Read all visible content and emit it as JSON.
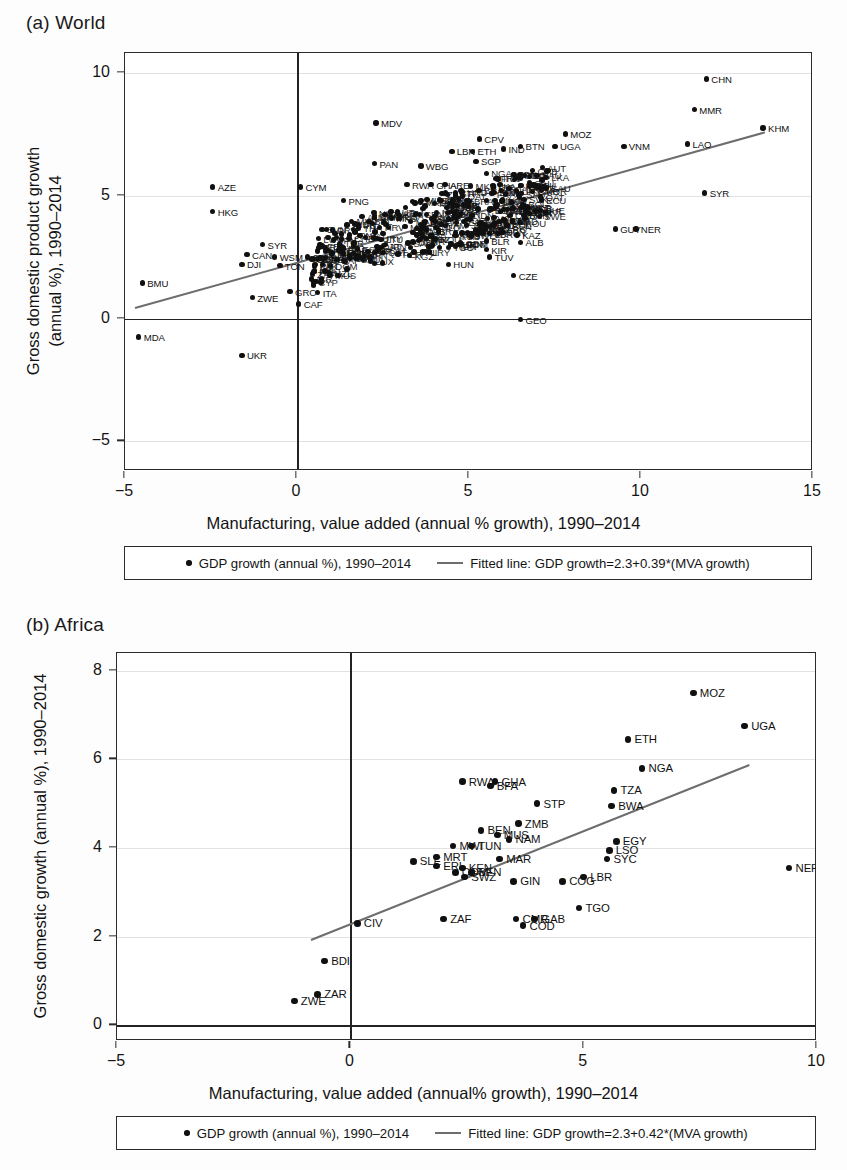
{
  "figure": {
    "background": "#fdfdfd",
    "point_color": "#101010",
    "fit_line_color": "#6d6d6d",
    "axis_color": "#2b2b2b"
  },
  "chart_data": [
    {
      "type": "scatter",
      "panel_id": "a",
      "title": "(a) World",
      "xlabel": "Manufacturing, value added (annual % growth), 1990–2014",
      "ylabel_line1": "Gross domestic product growth",
      "ylabel_line2": "(annual %), 1990–2014",
      "xlim": [
        -5,
        15
      ],
      "ylim": [
        -6.2,
        10.8
      ],
      "xticks": [
        -5,
        0,
        5,
        10,
        15
      ],
      "yticks": [
        10,
        5,
        0,
        -5
      ],
      "grid": true,
      "legend_position": "below",
      "legend": [
        {
          "marker": "dot",
          "label": "GDP growth (annual %), 1990–2014"
        },
        {
          "marker": "line",
          "label": "Fitted line: GDP growth=2.3+0.39*(MVA growth)"
        }
      ],
      "fit": {
        "intercept": 2.3,
        "slope": 0.39,
        "equation": "GDP growth=2.3+0.39*(MVA growth)",
        "x_start": -4.7,
        "x_end": 13.6
      },
      "points": [
        {
          "label": "CHN",
          "x": 11.9,
          "y": 9.75
        },
        {
          "label": "MMR",
          "x": 11.55,
          "y": 8.5
        },
        {
          "label": "KHM",
          "x": 13.55,
          "y": 7.75
        },
        {
          "label": "MDV",
          "x": 2.3,
          "y": 7.95
        },
        {
          "label": "MOZ",
          "x": 7.8,
          "y": 7.5
        },
        {
          "label": "CPV",
          "x": 5.3,
          "y": 7.3
        },
        {
          "label": "LAO",
          "x": 11.35,
          "y": 7.1
        },
        {
          "label": "VNM",
          "x": 9.5,
          "y": 7.0
        },
        {
          "label": "BTN",
          "x": 6.5,
          "y": 7.0
        },
        {
          "label": "UGA",
          "x": 7.5,
          "y": 7.0
        },
        {
          "label": "LBN",
          "x": 4.5,
          "y": 6.8
        },
        {
          "label": "ETH",
          "x": 5.1,
          "y": 6.8
        },
        {
          "label": "IND",
          "x": 6.0,
          "y": 6.9
        },
        {
          "label": "PAN",
          "x": 2.25,
          "y": 6.3
        },
        {
          "label": "WBG",
          "x": 3.6,
          "y": 6.2
        },
        {
          "label": "SGP",
          "x": 5.2,
          "y": 6.4
        },
        {
          "label": "NGA",
          "x": 5.5,
          "y": 5.9
        },
        {
          "label": "MYS",
          "x": 6.3,
          "y": 5.85
        },
        {
          "label": "RWA",
          "x": 3.2,
          "y": 5.45
        },
        {
          "label": "GHA",
          "x": 3.9,
          "y": 5.45
        },
        {
          "label": "ARE",
          "x": 4.3,
          "y": 5.45
        },
        {
          "label": "LKA",
          "x": 5.7,
          "y": 5.4
        },
        {
          "label": "KWT",
          "x": 6.5,
          "y": 5.4
        },
        {
          "label": "KOR",
          "x": 7.1,
          "y": 5.2
        },
        {
          "label": "CYM",
          "x": 0.1,
          "y": 5.35
        },
        {
          "label": "AZE",
          "x": -2.45,
          "y": 5.35
        },
        {
          "label": "SYR",
          "x": 11.85,
          "y": 5.1
        },
        {
          "label": "STP",
          "x": 4.6,
          "y": 5.1
        },
        {
          "label": "SVK",
          "x": 6.6,
          "y": 4.85
        },
        {
          "label": "PNG",
          "x": 1.35,
          "y": 4.8
        },
        {
          "label": "BEN",
          "x": 4.2,
          "y": 4.8
        },
        {
          "label": "MWI",
          "x": 4.6,
          "y": 4.6
        },
        {
          "label": "EGY",
          "x": 5.6,
          "y": 4.4
        },
        {
          "label": "BRN",
          "x": 6.6,
          "y": 4.2
        },
        {
          "label": "HKG",
          "x": -2.45,
          "y": 4.35
        },
        {
          "label": "GUY",
          "x": 9.25,
          "y": 3.65
        },
        {
          "label": "NER",
          "x": 9.85,
          "y": 3.65
        },
        {
          "label": "SYC",
          "x": 5.3,
          "y": 3.85
        },
        {
          "label": "POL",
          "x": 6.1,
          "y": 3.8
        },
        {
          "label": "LBR",
          "x": 5.6,
          "y": 3.45
        },
        {
          "label": "KAZ",
          "x": 6.4,
          "y": 3.4
        },
        {
          "label": "ALB",
          "x": 6.5,
          "y": 3.1
        },
        {
          "label": "BLR",
          "x": 5.5,
          "y": 3.15
        },
        {
          "label": "TGO",
          "x": 4.4,
          "y": 2.9
        },
        {
          "label": "KIR",
          "x": 5.5,
          "y": 2.8
        },
        {
          "label": "TUV",
          "x": 5.6,
          "y": 2.5
        },
        {
          "label": "HUN",
          "x": 4.4,
          "y": 2.2
        },
        {
          "label": "CZE",
          "x": 6.3,
          "y": 1.75
        },
        {
          "label": "SYR2",
          "x": -1.0,
          "y": 3.0
        },
        {
          "label": "CAN",
          "x": -1.45,
          "y": 2.6
        },
        {
          "label": "WSM",
          "x": -0.65,
          "y": 2.5
        },
        {
          "label": "CIV",
          "x": 0.3,
          "y": 2.5
        },
        {
          "label": "DJI",
          "x": -1.6,
          "y": 2.2
        },
        {
          "label": "TON",
          "x": -0.5,
          "y": 2.15
        },
        {
          "label": "GRC",
          "x": -0.2,
          "y": 1.1
        },
        {
          "label": "ITA",
          "x": 0.6,
          "y": 1.05
        },
        {
          "label": "ZWE",
          "x": -1.3,
          "y": 0.85
        },
        {
          "label": "CAF",
          "x": 0.05,
          "y": 0.6
        },
        {
          "label": "GEO",
          "x": 6.5,
          "y": -0.05
        },
        {
          "label": "BMU",
          "x": -4.5,
          "y": 1.45
        },
        {
          "label": "MDA",
          "x": -4.6,
          "y": -0.75
        },
        {
          "label": "UKR",
          "x": -1.6,
          "y": -1.5
        }
      ],
      "cluster_note": "dense unlabeled cluster of country markers between x=0.5 and x=7, y=1.5 to 5"
    },
    {
      "type": "scatter",
      "panel_id": "b",
      "title": "(b) Africa",
      "xlabel": "Manufacturing, value added (annual% growth), 1990–2014",
      "ylabel": "Gross domestic growth (annual %), 1990–2014",
      "xlim": [
        -5,
        10
      ],
      "ylim": [
        -0.35,
        8.4
      ],
      "xticks": [
        -5,
        0,
        5,
        10
      ],
      "yticks": [
        8,
        6,
        4,
        2,
        0
      ],
      "grid": true,
      "legend_position": "below",
      "legend": [
        {
          "marker": "dot",
          "label": "GDP growth (annual %), 1990–2014"
        },
        {
          "marker": "line",
          "label": "Fitted line: GDP growth=2.3+0.42*(MVA growth)"
        }
      ],
      "fit": {
        "intercept": 2.3,
        "slope": 0.42,
        "equation": "GDP growth=2.3+0.42*(MVA growth)",
        "x_start": -0.85,
        "x_end": 8.55
      },
      "points": [
        {
          "label": "MOZ",
          "x": 7.35,
          "y": 7.5
        },
        {
          "label": "UGA",
          "x": 8.45,
          "y": 6.75
        },
        {
          "label": "ETH",
          "x": 5.95,
          "y": 6.45
        },
        {
          "label": "NGA",
          "x": 6.25,
          "y": 5.8
        },
        {
          "label": "RWA",
          "x": 2.4,
          "y": 5.5
        },
        {
          "label": "GHA",
          "x": 3.1,
          "y": 5.5
        },
        {
          "label": "BFA",
          "x": 3.0,
          "y": 5.4
        },
        {
          "label": "TZA",
          "x": 5.65,
          "y": 5.3
        },
        {
          "label": "STP",
          "x": 4.0,
          "y": 5.0
        },
        {
          "label": "BWA",
          "x": 5.6,
          "y": 4.95
        },
        {
          "label": "ZMB",
          "x": 3.6,
          "y": 4.55
        },
        {
          "label": "BEN",
          "x": 2.8,
          "y": 4.4
        },
        {
          "label": "MUS",
          "x": 3.15,
          "y": 4.3
        },
        {
          "label": "NAM",
          "x": 3.4,
          "y": 4.2
        },
        {
          "label": "EGY",
          "x": 5.7,
          "y": 4.15
        },
        {
          "label": "MWI",
          "x": 2.2,
          "y": 4.05
        },
        {
          "label": "TUN",
          "x": 2.6,
          "y": 4.05
        },
        {
          "label": "LSO",
          "x": 5.55,
          "y": 3.95
        },
        {
          "label": "SYC",
          "x": 5.5,
          "y": 3.75
        },
        {
          "label": "MRT",
          "x": 1.85,
          "y": 3.8
        },
        {
          "label": "MAR",
          "x": 3.2,
          "y": 3.75
        },
        {
          "label": "SLE",
          "x": 1.35,
          "y": 3.7
        },
        {
          "label": "ERI",
          "x": 1.85,
          "y": 3.6
        },
        {
          "label": "KEN",
          "x": 2.4,
          "y": 3.55
        },
        {
          "label": "COM",
          "x": 2.25,
          "y": 3.45
        },
        {
          "label": "SEN",
          "x": 2.6,
          "y": 3.45
        },
        {
          "label": "SWZ",
          "x": 2.45,
          "y": 3.35
        },
        {
          "label": "LBR",
          "x": 5.0,
          "y": 3.35
        },
        {
          "label": "NER",
          "x": 9.4,
          "y": 3.55
        },
        {
          "label": "GIN",
          "x": 3.5,
          "y": 3.25
        },
        {
          "label": "COG",
          "x": 4.55,
          "y": 3.25
        },
        {
          "label": "TGO",
          "x": 4.9,
          "y": 2.65
        },
        {
          "label": "ZAF",
          "x": 2.0,
          "y": 2.4
        },
        {
          "label": "CMR",
          "x": 3.55,
          "y": 2.4
        },
        {
          "label": "GAB",
          "x": 3.95,
          "y": 2.4
        },
        {
          "label": "COD",
          "x": 3.7,
          "y": 2.25
        },
        {
          "label": "CIV",
          "x": 0.15,
          "y": 2.3
        },
        {
          "label": "BDI",
          "x": -0.55,
          "y": 1.45
        },
        {
          "label": "ZAR",
          "x": -0.7,
          "y": 0.7
        },
        {
          "label": "ZWE",
          "x": -1.2,
          "y": 0.55
        }
      ]
    }
  ]
}
